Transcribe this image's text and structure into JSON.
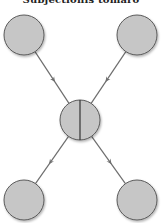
{
  "diagram": {
    "title": "Subjectionis tomaro",
    "node_fill": "#c6c6c6",
    "node_stroke": "#5a5a5a",
    "edge_color": "#6e6e6e",
    "nodes": [
      {
        "id": "top-left",
        "kind": "plain"
      },
      {
        "id": "top-right",
        "kind": "plain"
      },
      {
        "id": "center",
        "kind": "split"
      },
      {
        "id": "bottom-left",
        "kind": "plain"
      },
      {
        "id": "bottom-right",
        "kind": "plain"
      }
    ],
    "edges": [
      {
        "from": "top-left",
        "to": "center"
      },
      {
        "from": "top-right",
        "to": "center"
      },
      {
        "from": "center",
        "to": "bottom-left"
      },
      {
        "from": "center",
        "to": "bottom-right"
      }
    ]
  }
}
